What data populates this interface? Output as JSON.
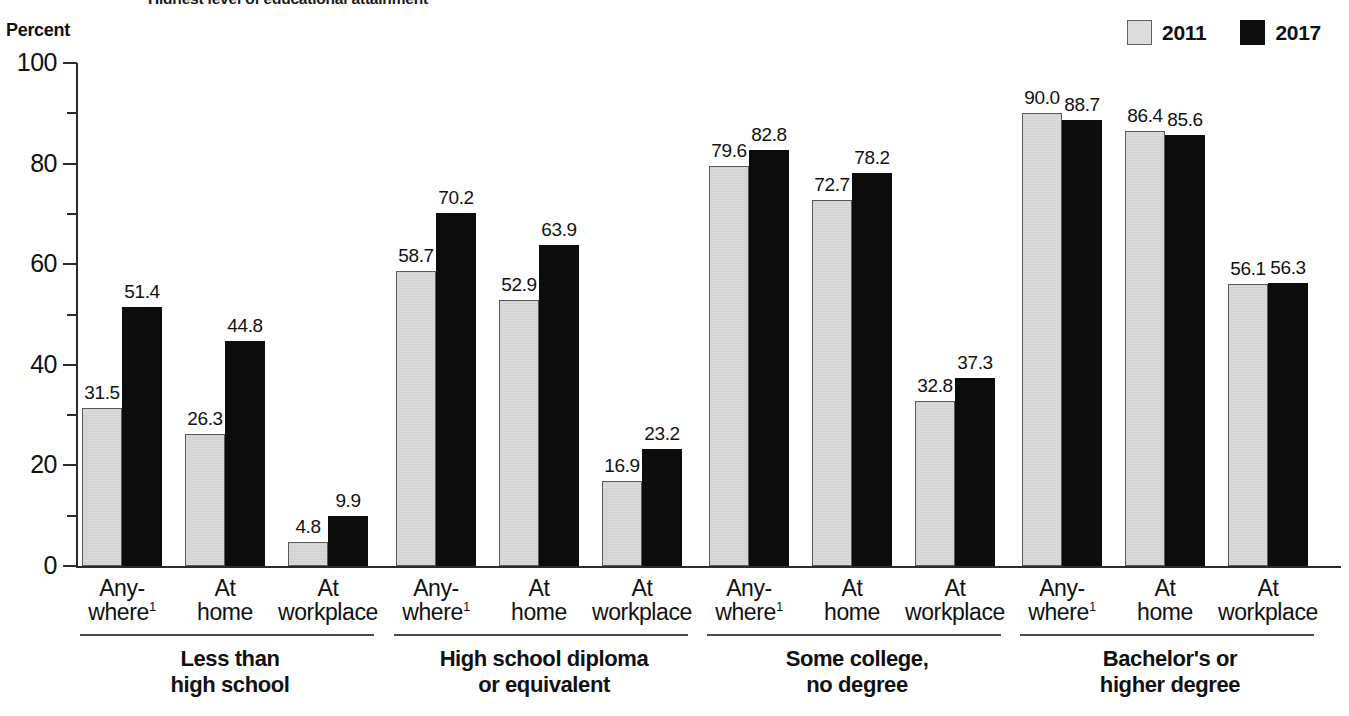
{
  "title": "Highest level of educational attainment",
  "axis": {
    "y_caption": "Percent",
    "ticks_major": [
      "100",
      "80",
      "60",
      "40",
      "20",
      "0"
    ],
    "y_min": 0,
    "y_max": 100
  },
  "legend": {
    "position": "top-right",
    "entries": [
      {
        "label": "2011",
        "color": "#dadada",
        "swatch": "light-gray-square"
      },
      {
        "label": "2017",
        "color": "#0c0c0c",
        "swatch": "black-square"
      }
    ]
  },
  "chart_data": {
    "type": "bar",
    "title": "Highest level of educational attainment",
    "xlabel": "",
    "ylabel": "Percent",
    "ylim": [
      0,
      100
    ],
    "grid": false,
    "legend_position": "top-right",
    "series": [
      {
        "name": "2011",
        "color": "#dadada"
      },
      {
        "name": "2017",
        "color": "#0c0c0c"
      }
    ],
    "groups": [
      {
        "label_line1": "Less than",
        "label_line2": "high school",
        "categories": [
          {
            "line1": "Any-",
            "line2": "where",
            "note": "1",
            "values": [
              31.5,
              51.4
            ]
          },
          {
            "line1": "At",
            "line2": "home",
            "note": "",
            "values": [
              26.3,
              44.8
            ]
          },
          {
            "line1": "At",
            "line2": "workplace",
            "note": "",
            "values": [
              4.8,
              9.9
            ]
          }
        ]
      },
      {
        "label_line1": "High school diploma",
        "label_line2": "or equivalent",
        "categories": [
          {
            "line1": "Any-",
            "line2": "where",
            "note": "1",
            "values": [
              58.7,
              70.2
            ]
          },
          {
            "line1": "At",
            "line2": "home",
            "note": "",
            "values": [
              52.9,
              63.9
            ]
          },
          {
            "line1": "At",
            "line2": "workplace",
            "note": "",
            "values": [
              16.9,
              23.2
            ]
          }
        ]
      },
      {
        "label_line1": "Some college,",
        "label_line2": "no degree",
        "categories": [
          {
            "line1": "Any-",
            "line2": "where",
            "note": "1",
            "values": [
              79.6,
              82.8
            ]
          },
          {
            "line1": "At",
            "line2": "home",
            "note": "",
            "values": [
              72.7,
              78.2
            ]
          },
          {
            "line1": "At",
            "line2": "workplace",
            "note": "",
            "values": [
              32.8,
              37.3
            ]
          }
        ]
      },
      {
        "label_line1": "Bachelor's or",
        "label_line2": "higher degree",
        "categories": [
          {
            "line1": "Any-",
            "line2": "where",
            "note": "1",
            "values": [
              90.0,
              88.7
            ]
          },
          {
            "line1": "At",
            "line2": "home",
            "note": "",
            "values": [
              86.4,
              85.6
            ]
          },
          {
            "line1": "At",
            "line2": "workplace",
            "note": "",
            "values": [
              56.1,
              56.3
            ]
          }
        ]
      }
    ]
  }
}
